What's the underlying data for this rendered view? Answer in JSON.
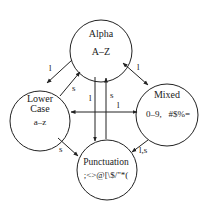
{
  "diagram": {
    "type": "state-diagram",
    "states": [
      {
        "id": "alpha",
        "name": "Alpha",
        "chars": "A–Z",
        "cx": 101,
        "cy": 51,
        "r": 31
      },
      {
        "id": "lower",
        "name_line1": "Lower",
        "name_line2": "Case",
        "chars": "a–z",
        "cx": 40,
        "cy": 121,
        "r": 30
      },
      {
        "id": "mixed",
        "name": "Mixed",
        "chars": "0–9,   #$%=",
        "cx": 167,
        "cy": 115,
        "r": 31
      },
      {
        "id": "punct",
        "name": "Punctuation",
        "chars": ";<>@[\\$/\"*(",
        "cx": 107,
        "cy": 170,
        "r": 30
      }
    ],
    "transitions": [
      {
        "from": "alpha",
        "to": "lower",
        "label": "l"
      },
      {
        "from": "lower",
        "to": "alpha",
        "label": "s"
      },
      {
        "from": "alpha",
        "to": "mixed",
        "label": "l",
        "bidirectional": true
      },
      {
        "from": "alpha",
        "to": "punct",
        "label": "l"
      },
      {
        "from": "punct",
        "to": "alpha",
        "label": "s"
      },
      {
        "from": "lower",
        "to": "mixed",
        "label": "l",
        "bidirectional": true
      },
      {
        "from": "lower",
        "to": "punct",
        "label": "s"
      },
      {
        "from": "mixed",
        "to": "punct",
        "label": "l,s"
      }
    ]
  }
}
